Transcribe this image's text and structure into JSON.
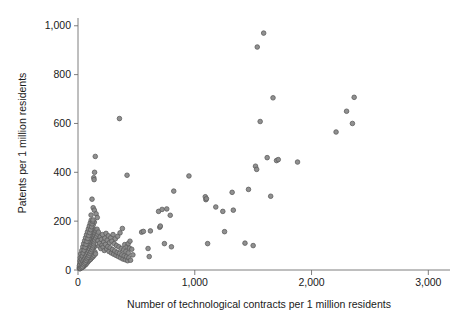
{
  "chart_data": {
    "type": "scatter",
    "title": "",
    "xlabel": "Number of technological contracts per 1 million residents",
    "ylabel": "Patents per 1 million residents",
    "xlim": [
      0,
      3100
    ],
    "ylim": [
      0,
      1040
    ],
    "xticks": [
      0,
      1000,
      2000,
      3000
    ],
    "xtick_labels": [
      "0",
      "1,000",
      "2,000",
      "3,000"
    ],
    "yticks": [
      0,
      200,
      400,
      600,
      800,
      1000
    ],
    "ytick_labels": [
      "0",
      "200",
      "400",
      "600",
      "800",
      "1,000"
    ],
    "grid": false,
    "legend": null,
    "marker": {
      "shape": "circle",
      "fill_color": "#8a8a8a",
      "edge_color": "#5d5d5d",
      "size_px": 4.6,
      "opacity": 0.95
    },
    "series": [
      {
        "name": "regions",
        "points": [
          [
            10,
            8
          ],
          [
            14,
            15
          ],
          [
            16,
            25
          ],
          [
            18,
            6
          ],
          [
            20,
            34
          ],
          [
            22,
            12
          ],
          [
            24,
            48
          ],
          [
            26,
            20
          ],
          [
            28,
            9
          ],
          [
            30,
            60
          ],
          [
            32,
            28
          ],
          [
            34,
            17
          ],
          [
            36,
            41
          ],
          [
            38,
            11
          ],
          [
            40,
            72
          ],
          [
            42,
            33
          ],
          [
            44,
            22
          ],
          [
            46,
            55
          ],
          [
            48,
            14
          ],
          [
            50,
            88
          ],
          [
            52,
            38
          ],
          [
            54,
            26
          ],
          [
            56,
            64
          ],
          [
            58,
            19
          ],
          [
            60,
            100
          ],
          [
            62,
            45
          ],
          [
            64,
            30
          ],
          [
            66,
            76
          ],
          [
            68,
            23
          ],
          [
            70,
            112
          ],
          [
            72,
            52
          ],
          [
            74,
            36
          ],
          [
            76,
            84
          ],
          [
            78,
            29
          ],
          [
            80,
            124
          ],
          [
            82,
            58
          ],
          [
            84,
            42
          ],
          [
            86,
            92
          ],
          [
            88,
            35
          ],
          [
            90,
            136
          ],
          [
            92,
            65
          ],
          [
            94,
            47
          ],
          [
            96,
            104
          ],
          [
            98,
            40
          ],
          [
            100,
            148
          ],
          [
            102,
            70
          ],
          [
            104,
            53
          ],
          [
            106,
            116
          ],
          [
            108,
            44
          ],
          [
            110,
            160
          ],
          [
            112,
            78
          ],
          [
            114,
            58
          ],
          [
            116,
            128
          ],
          [
            118,
            50
          ],
          [
            120,
            172
          ],
          [
            122,
            84
          ],
          [
            124,
            62
          ],
          [
            126,
            140
          ],
          [
            128,
            54
          ],
          [
            130,
            184
          ],
          [
            132,
            90
          ],
          [
            134,
            68
          ],
          [
            136,
            152
          ],
          [
            138,
            60
          ],
          [
            140,
            196
          ],
          [
            142,
            96
          ],
          [
            145,
            74
          ],
          [
            148,
            164
          ],
          [
            150,
            66
          ],
          [
            12,
            18
          ],
          [
            15,
            5
          ],
          [
            17,
            38
          ],
          [
            19,
            50
          ],
          [
            21,
            7
          ],
          [
            23,
            66
          ],
          [
            25,
            31
          ],
          [
            27,
            16
          ],
          [
            29,
            44
          ],
          [
            31,
            10
          ],
          [
            33,
            80
          ],
          [
            35,
            24
          ],
          [
            37,
            57
          ],
          [
            39,
            13
          ],
          [
            41,
            95
          ],
          [
            43,
            37
          ],
          [
            45,
            69
          ],
          [
            47,
            21
          ],
          [
            49,
            108
          ],
          [
            51,
            43
          ],
          [
            53,
            81
          ],
          [
            55,
            27
          ],
          [
            57,
            120
          ],
          [
            59,
            49
          ],
          [
            61,
            93
          ],
          [
            63,
            32
          ],
          [
            65,
            132
          ],
          [
            67,
            56
          ],
          [
            69,
            105
          ],
          [
            71,
            39
          ],
          [
            73,
            144
          ],
          [
            75,
            63
          ],
          [
            77,
            117
          ],
          [
            79,
            46
          ],
          [
            81,
            156
          ],
          [
            83,
            71
          ],
          [
            85,
            129
          ],
          [
            87,
            52
          ],
          [
            89,
            168
          ],
          [
            91,
            79
          ],
          [
            93,
            141
          ],
          [
            95,
            59
          ],
          [
            97,
            180
          ],
          [
            99,
            87
          ],
          [
            101,
            153
          ],
          [
            103,
            67
          ],
          [
            105,
            192
          ],
          [
            107,
            95
          ],
          [
            109,
            165
          ],
          [
            111,
            75
          ],
          [
            113,
            204
          ],
          [
            115,
            103
          ],
          [
            117,
            177
          ],
          [
            119,
            83
          ],
          [
            121,
            189
          ],
          [
            123,
            111
          ],
          [
            125,
            91
          ],
          [
            127,
            199
          ],
          [
            129,
            119
          ],
          [
            131,
            99
          ],
          [
            133,
            127
          ],
          [
            135,
            107
          ],
          [
            137,
            135
          ],
          [
            139,
            115
          ],
          [
            141,
            143
          ],
          [
            143,
            123
          ],
          [
            147,
            151
          ],
          [
            151,
            131
          ],
          [
            155,
            159
          ],
          [
            159,
            139
          ],
          [
            163,
            167
          ],
          [
            167,
            147
          ],
          [
            171,
            120
          ],
          [
            175,
            155
          ],
          [
            180,
            98
          ],
          [
            185,
            110
          ],
          [
            190,
            135
          ],
          [
            195,
            88
          ],
          [
            200,
            125
          ],
          [
            205,
            102
          ],
          [
            210,
            145
          ],
          [
            215,
            93
          ],
          [
            220,
            115
          ],
          [
            225,
            80
          ],
          [
            230,
            130
          ],
          [
            235,
            105
          ],
          [
            240,
            150
          ],
          [
            245,
            86
          ],
          [
            250,
            122
          ],
          [
            255,
            96
          ],
          [
            260,
            140
          ],
          [
            265,
            76
          ],
          [
            270,
            112
          ],
          [
            275,
            91
          ],
          [
            280,
            132
          ],
          [
            285,
            70
          ],
          [
            290,
            118
          ],
          [
            295,
            84
          ],
          [
            300,
            145
          ],
          [
            305,
            65
          ],
          [
            310,
            108
          ],
          [
            315,
            78
          ],
          [
            320,
            128
          ],
          [
            325,
            60
          ],
          [
            330,
            100
          ],
          [
            335,
            72
          ],
          [
            340,
            138
          ],
          [
            345,
            55
          ],
          [
            350,
            95
          ],
          [
            355,
            68
          ],
          [
            360,
            152
          ],
          [
            365,
            50
          ],
          [
            370,
            88
          ],
          [
            375,
            62
          ],
          [
            380,
            170
          ],
          [
            385,
            45
          ],
          [
            390,
            82
          ],
          [
            395,
            58
          ],
          [
            400,
            104
          ],
          [
            405,
            42
          ],
          [
            410,
            76
          ],
          [
            415,
            54
          ],
          [
            420,
            96
          ],
          [
            425,
            38
          ],
          [
            430,
            70
          ],
          [
            435,
            50
          ],
          [
            440,
            90
          ],
          [
            450,
            40
          ],
          [
            460,
            85
          ],
          [
            470,
            62
          ],
          [
            120,
            290
          ],
          [
            130,
            255
          ],
          [
            140,
            245
          ],
          [
            135,
            378
          ],
          [
            138,
            370
          ],
          [
            142,
            400
          ],
          [
            148,
            465
          ],
          [
            155,
            230
          ],
          [
            165,
            215
          ],
          [
            112,
            225
          ],
          [
            128,
            205
          ],
          [
            355,
            620
          ],
          [
            420,
            388
          ],
          [
            430,
            108
          ],
          [
            445,
            118
          ],
          [
            545,
            155
          ],
          [
            560,
            158
          ],
          [
            600,
            88
          ],
          [
            610,
            55
          ],
          [
            620,
            160
          ],
          [
            690,
            240
          ],
          [
            700,
            175
          ],
          [
            705,
            180
          ],
          [
            720,
            248
          ],
          [
            740,
            108
          ],
          [
            760,
            250
          ],
          [
            790,
            224
          ],
          [
            800,
            95
          ],
          [
            820,
            323
          ],
          [
            950,
            385
          ],
          [
            1090,
            300
          ],
          [
            1095,
            288
          ],
          [
            1100,
            292
          ],
          [
            1110,
            108
          ],
          [
            1180,
            258
          ],
          [
            1240,
            240
          ],
          [
            1255,
            157
          ],
          [
            1320,
            318
          ],
          [
            1330,
            245
          ],
          [
            1430,
            110
          ],
          [
            1460,
            330
          ],
          [
            1500,
            100
          ],
          [
            1520,
            425
          ],
          [
            1530,
            412
          ],
          [
            1535,
            913
          ],
          [
            1560,
            608
          ],
          [
            1590,
            970
          ],
          [
            1620,
            460
          ],
          [
            1650,
            302
          ],
          [
            1670,
            705
          ],
          [
            1700,
            448
          ],
          [
            1715,
            452
          ],
          [
            1880,
            442
          ],
          [
            2210,
            565
          ],
          [
            2300,
            650
          ],
          [
            2350,
            600
          ],
          [
            2365,
            707
          ]
        ]
      }
    ]
  },
  "axes_geometry": {
    "plot_left_px": 78,
    "plot_right_px": 440,
    "plot_top_px": 16,
    "plot_bottom_px": 270
  }
}
